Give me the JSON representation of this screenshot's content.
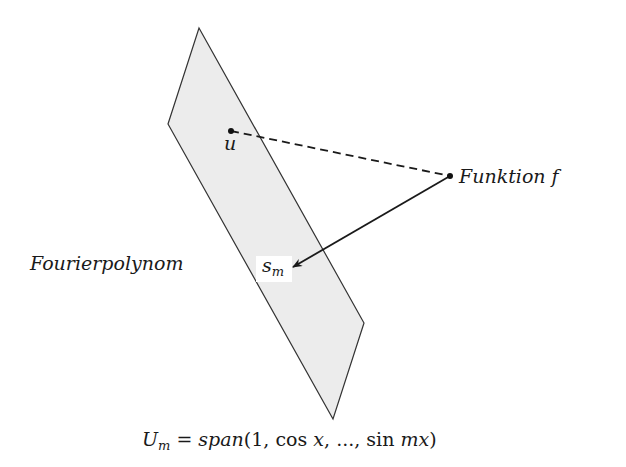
{
  "diagram": {
    "type": "projection",
    "plane": {
      "label_subspace": "U_m",
      "vertices": [
        [
          199,
          28
        ],
        [
          364,
          323
        ],
        [
          333,
          419
        ],
        [
          168,
          124
        ]
      ],
      "fill": "#ececec",
      "stroke": "#333333"
    },
    "points": {
      "u": {
        "label": "u",
        "x": 231,
        "y": 131
      },
      "f": {
        "label": "Funktion f",
        "x": 450,
        "y": 176
      }
    },
    "edges": [
      {
        "from": "u",
        "to": "f",
        "style": "dashed"
      },
      {
        "from": "f",
        "to": "s_m",
        "style": "arrow"
      }
    ],
    "labels": {
      "u": "u",
      "funktion_word": "Funktion",
      "funktion_var": "f",
      "fourierpolynom": "Fourierpolynom",
      "s_base": "s",
      "s_sub": "m",
      "caption_U": "U",
      "caption_sub": "m",
      "caption_eq": "=",
      "caption_span": "span",
      "caption_args_open": "(1, ",
      "caption_cos": "cos",
      "caption_x": " x",
      "caption_mid": ", ..., ",
      "caption_sin": "sin",
      "caption_mx": " mx",
      "caption_close": ")"
    }
  }
}
